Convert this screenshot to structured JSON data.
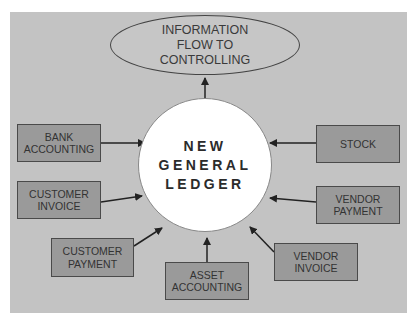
{
  "diagram": {
    "colors": {
      "background": "#c3c3c3",
      "box_fill": "#9a9a9a",
      "center_fill": "#ffffff",
      "stroke": "#333333"
    },
    "target": {
      "line1": "INFORMATION",
      "line2": "FLOW TO",
      "line3": "CONTROLLING"
    },
    "center": {
      "line1": "NEW",
      "line2": "GENERAL",
      "line3": "LEDGER"
    },
    "sources": [
      {
        "id": "bank-accounting",
        "line1": "BANK",
        "line2": "ACCOUNTING"
      },
      {
        "id": "customer-invoice",
        "line1": "CUSTOMER",
        "line2": "INVOICE"
      },
      {
        "id": "customer-payment",
        "line1": "CUSTOMER",
        "line2": "PAYMENT"
      },
      {
        "id": "asset-accounting",
        "line1": "ASSET",
        "line2": "ACCOUNTING"
      },
      {
        "id": "vendor-invoice",
        "line1": "VENDOR",
        "line2": "INVOICE"
      },
      {
        "id": "vendor-payment",
        "line1": "VENDOR",
        "line2": "PAYMENT"
      },
      {
        "id": "stock",
        "line1": "STOCK",
        "line2": ""
      }
    ],
    "edges": [
      {
        "from": "bank-accounting",
        "to": "new-general-ledger"
      },
      {
        "from": "customer-invoice",
        "to": "new-general-ledger"
      },
      {
        "from": "customer-payment",
        "to": "new-general-ledger"
      },
      {
        "from": "asset-accounting",
        "to": "new-general-ledger"
      },
      {
        "from": "vendor-invoice",
        "to": "new-general-ledger"
      },
      {
        "from": "vendor-payment",
        "to": "new-general-ledger"
      },
      {
        "from": "stock",
        "to": "new-general-ledger"
      },
      {
        "from": "new-general-ledger",
        "to": "information-flow-to-controlling"
      }
    ]
  }
}
